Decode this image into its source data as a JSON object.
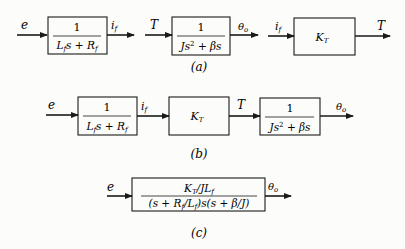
{
  "diagram": {
    "panel_a": {
      "label": "(a)",
      "blocks": [
        {
          "input": "e",
          "numerator": "1",
          "denominator_parts": [
            "L",
            "f",
            "s + R",
            "f"
          ],
          "output": "i",
          "output_sub": "f"
        },
        {
          "input": "T",
          "numerator": "1",
          "denominator_parts": [
            "Js",
            "2",
            " + βs"
          ],
          "output": "θ",
          "output_sub": "o"
        },
        {
          "input": "i",
          "input_sub": "f",
          "gain": "K",
          "gain_sub": "T",
          "output": "T"
        }
      ]
    },
    "panel_b": {
      "label": "(b)",
      "input": "e",
      "blocks": [
        {
          "numerator": "1",
          "denominator_parts": [
            "L",
            "f",
            "s + R",
            "f"
          ],
          "output": "i",
          "output_sub": "f"
        },
        {
          "gain": "K",
          "gain_sub": "T",
          "output": "T"
        },
        {
          "numerator": "1",
          "denominator_parts": [
            "Js",
            "2",
            " + βs"
          ],
          "output": "θ",
          "output_sub": "o"
        }
      ]
    },
    "panel_c": {
      "label": "(c)",
      "input": "e",
      "numerator_parts": [
        "K",
        "T",
        "/JL",
        "f"
      ],
      "denominator_parts": [
        "(s + R",
        "f",
        "/L",
        "f",
        ")s(s + β/J)"
      ],
      "output": "θ",
      "output_sub": "o"
    }
  }
}
